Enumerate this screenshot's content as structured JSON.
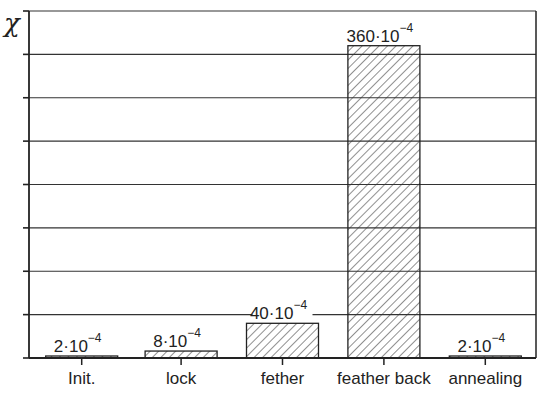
{
  "chart_data": {
    "type": "bar",
    "title": "",
    "xlabel": "",
    "ylabel": "χ",
    "ylim": [
      0,
      400
    ],
    "y_unit_multiplier": "10^-4",
    "ytick_step": 50,
    "ytick_labels_shown": false,
    "grid": "horizontal",
    "categories": [
      "Init.",
      "lock",
      "fether",
      "feather back",
      "annealing"
    ],
    "values": [
      2,
      8,
      40,
      360,
      2
    ],
    "data_labels": [
      {
        "mantissa": "2·10",
        "exponent": "−4"
      },
      {
        "mantissa": "8·10",
        "exponent": "−4"
      },
      {
        "mantissa": "40·10",
        "exponent": "−4"
      },
      {
        "mantissa": "360·10",
        "exponent": "−4"
      },
      {
        "mantissa": "2·10",
        "exponent": "−4"
      }
    ],
    "bar_fill": "diagonal-hatch",
    "colors": {
      "line": "#222222",
      "background": "#ffffff"
    }
  }
}
